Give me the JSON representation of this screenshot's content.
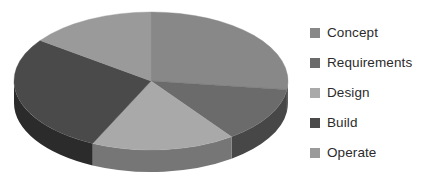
{
  "chart_data": {
    "type": "pie",
    "title": "",
    "three_d": true,
    "categories": [
      "Concept",
      "Requirements",
      "Design",
      "Build",
      "Operate"
    ],
    "values": [
      27,
      13,
      17,
      28,
      15
    ],
    "units": "percent",
    "colors": [
      "#888888",
      "#6b6b6b",
      "#a9a9a9",
      "#4a4a4a",
      "#9a9a9a"
    ],
    "side_colors": [
      "#5e5e5e",
      "#474747",
      "#767676",
      "#2b2b2b",
      "#6d6d6d"
    ],
    "start_angle_deg": 0,
    "direction": "clockwise",
    "legend": {
      "position": "right",
      "entries": [
        {
          "label": "Concept",
          "color": "#888888"
        },
        {
          "label": "Requirements",
          "color": "#6b6b6b"
        },
        {
          "label": "Design",
          "color": "#a9a9a9"
        },
        {
          "label": "Build",
          "color": "#4a4a4a"
        },
        {
          "label": "Operate",
          "color": "#9a9a9a"
        }
      ]
    },
    "axis_labels": {
      "x": "",
      "y": ""
    },
    "grid": false,
    "data_labels_visible": false
  },
  "geometry": {
    "center_x": 151,
    "center_y": 81,
    "radius_x": 137,
    "radius_y": 69,
    "depth": 22
  }
}
